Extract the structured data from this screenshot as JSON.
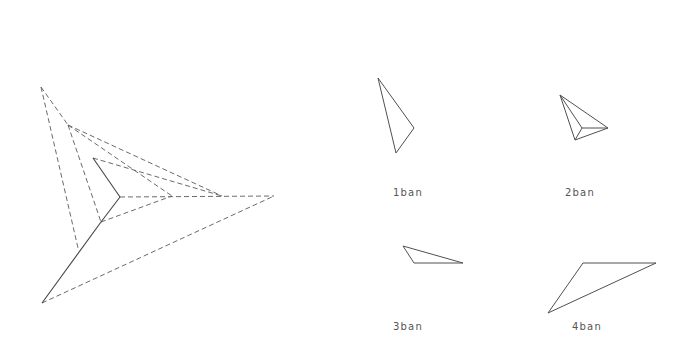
{
  "figure": {
    "main_diagram": {
      "name": "composite-dashed-construction",
      "points": {
        "A": [
          41,
          87
        ],
        "B": [
          68,
          125
        ],
        "C": [
          93,
          158
        ],
        "O": [
          120,
          197
        ],
        "M": [
          101,
          222
        ],
        "L": [
          78,
          248
        ],
        "P": [
          42,
          303
        ],
        "D": [
          172,
          196
        ],
        "E": [
          222,
          196
        ],
        "F": [
          274,
          196
        ]
      },
      "solid_segments": [
        [
          "C",
          "O"
        ],
        [
          "O",
          "M"
        ],
        [
          "M",
          "P"
        ]
      ],
      "dashed_segments": [
        [
          "A",
          "L"
        ],
        [
          "A",
          "B"
        ],
        [
          "B",
          "M"
        ],
        [
          "B",
          "E"
        ],
        [
          "B",
          "D"
        ],
        [
          "C",
          "E"
        ],
        [
          "O",
          "F"
        ],
        [
          "M",
          "D"
        ],
        [
          "P",
          "F"
        ]
      ]
    },
    "panels": [
      {
        "label": "1ban",
        "label_pos": [
          408,
          192
        ],
        "polygon": [
          [
            378,
            78
          ],
          [
            414,
            128
          ],
          [
            396,
            153
          ]
        ],
        "inner_lines": []
      },
      {
        "label": "2ban",
        "label_pos": [
          580,
          192
        ],
        "polygon": [
          [
            560,
            95
          ],
          [
            608,
            128
          ],
          [
            575,
            140
          ]
        ],
        "inner_point": [
          582,
          128
        ],
        "inner_lines": [
          [
            [
              560,
              95
            ],
            [
              582,
              128
            ]
          ],
          [
            [
              582,
              128
            ],
            [
              608,
              128
            ]
          ],
          [
            [
              582,
              128
            ],
            [
              575,
              140
            ]
          ]
        ]
      },
      {
        "label": "3ban",
        "label_pos": [
          408,
          326
        ],
        "polygon": [
          [
            403,
            246
          ],
          [
            414,
            263
          ],
          [
            463,
            263
          ]
        ],
        "inner_lines": []
      },
      {
        "label": "4ban",
        "label_pos": [
          587,
          326
        ],
        "polygon": [
          [
            583,
            263
          ],
          [
            656,
            263
          ],
          [
            548,
            313
          ]
        ],
        "inner_lines": []
      }
    ]
  },
  "labels": {
    "panel1": "1ban",
    "panel2": "2ban",
    "panel3": "3ban",
    "panel4": "4ban"
  }
}
